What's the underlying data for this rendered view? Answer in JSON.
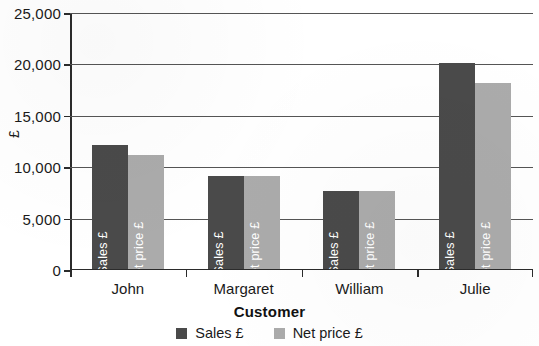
{
  "chart_data": {
    "type": "bar",
    "title": "",
    "subtitle": "",
    "xlabel": "Customer",
    "ylabel": "£",
    "categories": [
      "John",
      "Margaret",
      "William",
      "Julie"
    ],
    "series": [
      {
        "name": "Sales £",
        "values": [
          12000,
          9000,
          7500,
          20000
        ],
        "color": "#4a4a4a"
      },
      {
        "name": "Net price £",
        "values": [
          11000,
          9000,
          7500,
          18000
        ],
        "color": "#ababab"
      }
    ],
    "bar_inner_labels": [
      "Sales £",
      "Net price £"
    ],
    "ylim": [
      0,
      25000
    ],
    "yticks": [
      0,
      5000,
      10000,
      15000,
      20000,
      25000
    ],
    "ytick_labels": [
      "0",
      "5,000",
      "10,000",
      "15,000",
      "20,000",
      "25,000"
    ],
    "grid": true,
    "grid_axis": "y",
    "legend_position": "bottom",
    "legend": [
      "Sales £",
      "Net price £"
    ],
    "background_color": "#ffffff",
    "axis_color": "#2b2b2b"
  }
}
